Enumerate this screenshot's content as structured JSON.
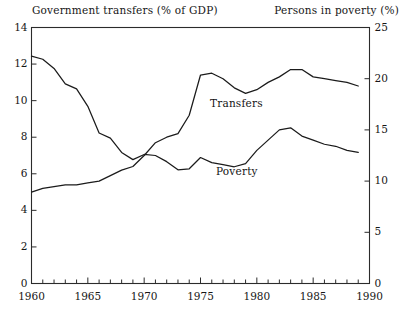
{
  "header": {
    "left_axis_title": "Government transfers (% of GDP)",
    "right_axis_title": "Persons in poverty (%)"
  },
  "annotations": {
    "transfers_label": "Transfers",
    "poverty_label": "Poverty"
  },
  "axes": {
    "left_ticks": [
      "0",
      "2",
      "4",
      "6",
      "8",
      "10",
      "12",
      "14"
    ],
    "right_ticks": [
      "0",
      "5",
      "10",
      "15",
      "20",
      "25"
    ],
    "x_ticks": [
      "1960",
      "1965",
      "1970",
      "1975",
      "1980",
      "1985",
      "1990"
    ]
  },
  "chart_data": {
    "type": "line",
    "title": "",
    "xlabel": "",
    "ylabel": "Government transfers (% of GDP)",
    "y2label": "Persons in poverty (%)",
    "xlim": [
      1960,
      1990
    ],
    "ylim": [
      0,
      14
    ],
    "y2lim": [
      0,
      25
    ],
    "xticks": [
      1960,
      1965,
      1970,
      1975,
      1980,
      1985,
      1990
    ],
    "yticks": [
      0,
      2,
      4,
      6,
      8,
      10,
      12,
      14
    ],
    "y2ticks": [
      0,
      5,
      10,
      15,
      20,
      25
    ],
    "minor_xticks": "annual",
    "grid": false,
    "legend": "inline-labels",
    "line_color": "#1b1b1b",
    "x": [
      1960,
      1961,
      1962,
      1963,
      1964,
      1965,
      1966,
      1967,
      1968,
      1969,
      1970,
      1971,
      1972,
      1973,
      1974,
      1975,
      1976,
      1977,
      1978,
      1979,
      1980,
      1981,
      1982,
      1983,
      1984,
      1985,
      1986,
      1987,
      1988,
      1989
    ],
    "series": [
      {
        "name": "Transfers",
        "axis": "left",
        "unit": "% of GDP",
        "values": [
          5.0,
          5.2,
          5.3,
          5.4,
          5.4,
          5.5,
          5.6,
          5.9,
          6.2,
          6.4,
          7.0,
          7.7,
          8.0,
          8.2,
          9.2,
          11.4,
          11.5,
          11.2,
          10.7,
          10.4,
          10.6,
          11.0,
          11.3,
          11.7,
          11.7,
          11.3,
          11.2,
          11.1,
          11.0,
          10.8
        ]
      },
      {
        "name": "Poverty",
        "axis": "right",
        "unit": "%",
        "values": [
          22.2,
          21.9,
          21.0,
          19.5,
          19.0,
          17.3,
          14.7,
          14.2,
          12.8,
          12.1,
          12.6,
          12.5,
          11.9,
          11.1,
          11.2,
          12.3,
          11.8,
          11.6,
          11.4,
          11.7,
          13.0,
          14.0,
          15.0,
          15.2,
          14.4,
          14.0,
          13.6,
          13.4,
          13.0,
          12.8
        ]
      }
    ]
  }
}
